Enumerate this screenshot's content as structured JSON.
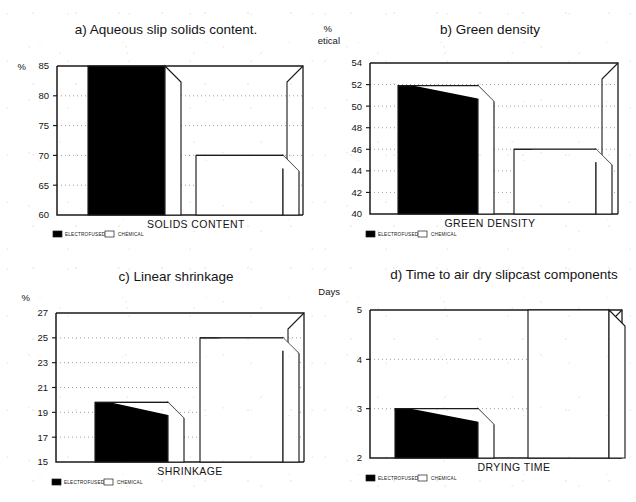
{
  "figure": {
    "legend": {
      "series_a": "ELECTROFUSED",
      "series_b": "CHEMICAL"
    },
    "colors": {
      "series_a": "#000000",
      "series_b": "#ffffff",
      "line": "#1a1a1a",
      "grid": "#8a8a8a"
    }
  },
  "chart_data": [
    {
      "id": "a",
      "type": "bar",
      "title": "a) Aqueous slip solids content.",
      "xlabel": "SOLIDS CONTENT",
      "ylabel": "%",
      "ylabel_line2": "",
      "categories": [
        "ELECTROFUSED",
        "CHEMICAL"
      ],
      "series": [
        {
          "name": "value",
          "values": [
            85,
            70
          ]
        }
      ],
      "ylim": [
        60,
        85
      ],
      "yticks": [
        60,
        65,
        70,
        75,
        80,
        85
      ],
      "ytick_labels": [
        "60",
        "65",
        "70",
        "75",
        "80",
        "85"
      ],
      "grid": true,
      "legend_position": "below-axis-left",
      "note": "electrofused bar is clipped at the top of the axis (>=85)"
    },
    {
      "id": "b",
      "type": "bar",
      "title": "b) Green density",
      "xlabel": "GREEN DENSITY",
      "ylabel": "%",
      "ylabel_line2": "Theoretical",
      "categories": [
        "ELECTROFUSED",
        "CHEMICAL"
      ],
      "series": [
        {
          "name": "value",
          "values": [
            51.9,
            46
          ]
        }
      ],
      "ylim": [
        40,
        54
      ],
      "yticks": [
        40,
        42,
        44,
        46,
        48,
        50,
        52,
        54
      ],
      "ytick_labels": [
        "40",
        "42",
        "44",
        "46",
        "48",
        "50",
        "52",
        "54"
      ],
      "grid": true,
      "legend_position": "below-axis-left"
    },
    {
      "id": "c",
      "type": "bar",
      "title": "c) Linear shrinkage",
      "xlabel": "SHRINKAGE",
      "ylabel": "%",
      "ylabel_line2": "",
      "categories": [
        "ELECTROFUSED",
        "CHEMICAL"
      ],
      "series": [
        {
          "name": "value",
          "values": [
            19.8,
            25
          ]
        }
      ],
      "ylim": [
        15,
        27
      ],
      "yticks": [
        15,
        17,
        19,
        21,
        23,
        25,
        27
      ],
      "ytick_labels": [
        "15",
        "17",
        "19",
        "21",
        "23",
        "25",
        "27"
      ],
      "grid": true,
      "legend_position": "below-axis-left"
    },
    {
      "id": "d",
      "type": "bar",
      "title": "d) Time to air dry slipcast components",
      "xlabel": "DRYING TIME",
      "ylabel": "Days",
      "ylabel_line2": "",
      "categories": [
        "ELECTROFUSED",
        "CHEMICAL"
      ],
      "series": [
        {
          "name": "value",
          "values": [
            3,
            5
          ]
        }
      ],
      "ylim": [
        2,
        5
      ],
      "yticks": [
        2,
        3,
        4,
        5
      ],
      "ytick_labels": [
        "2",
        "3",
        "4",
        "5"
      ],
      "grid": true,
      "legend_position": "below-axis-left",
      "note": "chemical bar is clipped at the top of the axis (>=5)"
    }
  ]
}
